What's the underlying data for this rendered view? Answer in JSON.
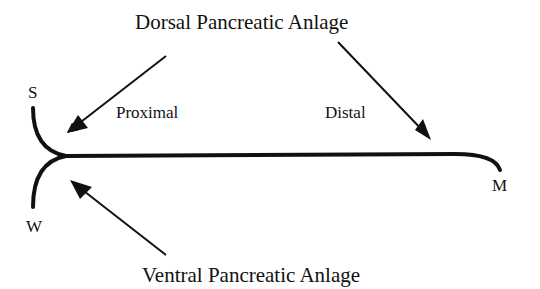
{
  "labels": {
    "dorsal": "Dorsal  Pancreatic Anlage",
    "ventral": "Ventral  Pancreatic Anlage",
    "proximal": "Proximal",
    "distal": "Distal",
    "s": "S",
    "w": "W",
    "m": "M"
  },
  "colors": {
    "ink": "#111111",
    "background": "#ffffff"
  }
}
